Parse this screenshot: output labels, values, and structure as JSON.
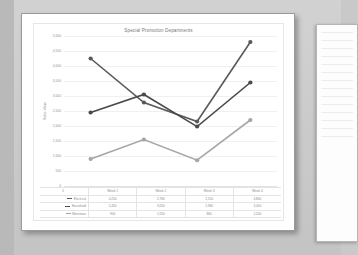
{
  "document": {
    "page_label": "chart-page",
    "secondary_page_label": "next-page-preview"
  },
  "chart_data": {
    "type": "line",
    "title": "Special Promotion Departments",
    "xlabel": "",
    "ylabel": "Sales Value",
    "categories": [
      "Week 1",
      "Week 2",
      "Week 3",
      "Week 4"
    ],
    "ylim": [
      0,
      5000
    ],
    "yticks": [
      0,
      500,
      1000,
      1500,
      2000,
      2500,
      3000,
      3500,
      4000,
      4500,
      5000
    ],
    "ytick_labels": [
      "0",
      "500",
      "1,000",
      "1,500",
      "2,000",
      "2,500",
      "3,000",
      "3,500",
      "4,000",
      "4,500",
      "5,000"
    ],
    "grid": true,
    "legend_position": "data-table",
    "series": [
      {
        "name": "Electrical",
        "color": "#595959",
        "values": [
          4250,
          2780,
          2150,
          4800
        ]
      },
      {
        "name": "Household",
        "color": "#4a4a4a",
        "values": [
          2450,
          3050,
          1980,
          3450
        ]
      },
      {
        "name": "Menswear",
        "color": "#a6a6a6",
        "values": [
          900,
          1550,
          860,
          2200
        ]
      }
    ]
  },
  "data_table": {
    "corner_label": "0",
    "headers": [
      "Week 1",
      "Week 2",
      "Week 3",
      "Week 4"
    ],
    "rows": [
      {
        "label": "Electrical",
        "color": "#595959",
        "values": [
          "4,250",
          "2,780",
          "2,150",
          "4,800"
        ]
      },
      {
        "label": "Household",
        "color": "#4a4a4a",
        "values": [
          "2,450",
          "3,050",
          "1,980",
          "3,450"
        ]
      },
      {
        "label": "Menswear",
        "color": "#a6a6a6",
        "values": [
          "900",
          "1,550",
          "860",
          "2,200"
        ]
      }
    ]
  }
}
